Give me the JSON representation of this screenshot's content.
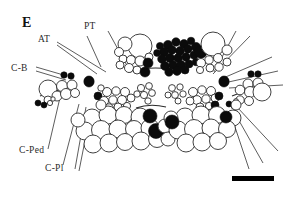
{
  "figure": {
    "panel_label": "E",
    "background_color": "#ffffff",
    "ink_color": "#111111",
    "width": 294,
    "height": 200
  },
  "labels": [
    {
      "id": "AT",
      "text": "AT",
      "x": 38,
      "y": 42
    },
    {
      "id": "PT",
      "text": "PT",
      "x": 86,
      "y": 29
    },
    {
      "id": "C-B",
      "text": "C-B",
      "x": 13,
      "y": 70
    },
    {
      "id": "C-Ped",
      "text": "C-Ped",
      "x": 21,
      "y": 154
    },
    {
      "id": "C-Pl",
      "text": "C-Pl",
      "x": 47,
      "y": 171
    }
  ],
  "leader_lines": [
    {
      "name": "at-leader-1",
      "x1": 57,
      "y1": 42,
      "x2": 106,
      "y2": 72
    },
    {
      "name": "at-leader-2",
      "x1": 57,
      "y1": 45,
      "x2": 97,
      "y2": 74
    },
    {
      "name": "pt-leader-1",
      "x1": 86,
      "y1": 35,
      "x2": 101,
      "y2": 67
    },
    {
      "name": "pt-leader-2",
      "x1": 108,
      "y1": 32,
      "x2": 131,
      "y2": 73
    },
    {
      "name": "cb-leader-1",
      "x1": 36,
      "y1": 68,
      "x2": 67,
      "y2": 76
    },
    {
      "name": "cb-leader-2",
      "x1": 36,
      "y1": 72,
      "x2": 66,
      "y2": 80
    },
    {
      "name": "cped-leader",
      "x1": 48,
      "y1": 149,
      "x2": 62,
      "y2": 89
    },
    {
      "name": "cpl-leader-1",
      "x1": 62,
      "y1": 166,
      "x2": 79,
      "y2": 104
    },
    {
      "name": "cpl-leader-2",
      "x1": 74,
      "y1": 170,
      "x2": 85,
      "y2": 107
    },
    {
      "name": "cpl-leader-3",
      "x1": 77,
      "y1": 172,
      "x2": 90,
      "y2": 110
    },
    {
      "name": "right-leader-1",
      "x1": 234,
      "y1": 33,
      "x2": 214,
      "y2": 72
    },
    {
      "name": "right-leader-2",
      "x1": 247,
      "y1": 37,
      "x2": 213,
      "y2": 74
    },
    {
      "name": "right-leader-3",
      "x1": 270,
      "y1": 58,
      "x2": 221,
      "y2": 79
    },
    {
      "name": "right-leader-4",
      "x1": 276,
      "y1": 72,
      "x2": 224,
      "y2": 83
    },
    {
      "name": "right-leader-5",
      "x1": 281,
      "y1": 86,
      "x2": 228,
      "y2": 88
    },
    {
      "name": "right-leader-6",
      "x1": 276,
      "y1": 152,
      "x2": 236,
      "y2": 107
    },
    {
      "name": "right-leader-7",
      "x1": 262,
      "y1": 163,
      "x2": 233,
      "y2": 110
    },
    {
      "name": "right-leader-8",
      "x1": 249,
      "y1": 168,
      "x2": 230,
      "y2": 112
    }
  ],
  "scalebar": {
    "name": "scale-bar",
    "x": 232,
    "y": 176,
    "width": 42,
    "height": 5,
    "caption": ""
  },
  "cell_clusters": [
    {
      "name": "upper-left-open-group",
      "fill": "open",
      "count": 11
    },
    {
      "name": "upper-center-dark-group",
      "fill": "filled",
      "count": 34
    },
    {
      "name": "upper-right-open-group",
      "fill": "open",
      "count": 9
    },
    {
      "name": "left-lateral-group",
      "fill": "open",
      "count": 9
    },
    {
      "name": "right-lateral-group",
      "fill": "open",
      "count": 10
    },
    {
      "name": "mid-left-small-group",
      "fill": "open",
      "count": 16
    },
    {
      "name": "mid-center-small-group",
      "fill": "open",
      "count": 13
    },
    {
      "name": "mid-right-small-group",
      "fill": "open",
      "count": 15
    },
    {
      "name": "lower-left-large-group",
      "fill": "open",
      "count": 27
    },
    {
      "name": "lower-right-large-group",
      "fill": "open",
      "count": 26
    },
    {
      "name": "midline-dark-cells",
      "fill": "filled",
      "count": 14
    }
  ]
}
